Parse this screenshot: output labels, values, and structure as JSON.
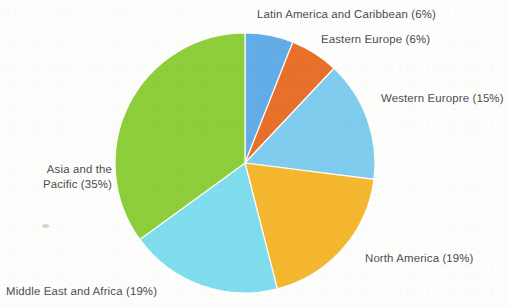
{
  "chart_data": {
    "type": "pie",
    "title": "",
    "subtitle": "",
    "xlabel": "",
    "ylabel": "",
    "legend_position": "none",
    "labels_position": "outside-callout",
    "grid": false,
    "start_angle_deg": 0,
    "direction": "clockwise",
    "total_percent": 100,
    "categories": [
      "Latin America and Caribbean",
      "Eastern Europe",
      "Western Europre",
      "North America",
      "Middle East and Africa",
      "Asia and the Pacific"
    ],
    "values": [
      6,
      6,
      15,
      19,
      19,
      35
    ],
    "value_unit": "%",
    "colors": [
      "#62ACE8",
      "#E8702A",
      "#7FCCEE",
      "#F5B730",
      "#7FDDEE",
      "#8DCE3A"
    ],
    "slices": [
      {
        "name": "Latin America and Caribbean",
        "value": 6,
        "label": "Latin America and Caribbean (6%)",
        "color": "#62ACE8",
        "start_deg": 0,
        "end_deg": 21.6
      },
      {
        "name": "Eastern Europe",
        "value": 6,
        "label": "Eastern Europe (6%)",
        "color": "#E8702A",
        "start_deg": 21.6,
        "end_deg": 43.2
      },
      {
        "name": "Western Europre",
        "value": 15,
        "label": "Western Europre (15%)",
        "color": "#7FCCEE",
        "start_deg": 43.2,
        "end_deg": 97.2
      },
      {
        "name": "North America",
        "value": 19,
        "label": "North America (19%)",
        "color": "#F5B730",
        "start_deg": 97.2,
        "end_deg": 165.6
      },
      {
        "name": "Middle East and Africa",
        "value": 19,
        "label": "Middle East and Africa (19%)",
        "color": "#7FDDEE",
        "start_deg": 165.6,
        "end_deg": 234.0
      },
      {
        "name": "Asia and the Pacific",
        "value": 35,
        "label": "Asia and the Pacific (35%)",
        "color": "#8DCE3A",
        "start_deg": 234.0,
        "end_deg": 360.0
      }
    ]
  },
  "labels": {
    "latin_america": "Latin America and Caribbean (6%)",
    "eastern_europe": "Eastern Europe (6%)",
    "western_europe": "Western Europre (15%)",
    "north_america": "North America (19%)",
    "middle_east": "Middle East and Africa (19%)",
    "asia_pacific_line1": "Asia and the",
    "asia_pacific_line2": "Pacific (35%)"
  },
  "geometry": {
    "center_x": 245,
    "center_y": 163,
    "radius": 130
  },
  "style": {
    "background": "#fdfdfb",
    "label_color": "#4b4b50"
  }
}
